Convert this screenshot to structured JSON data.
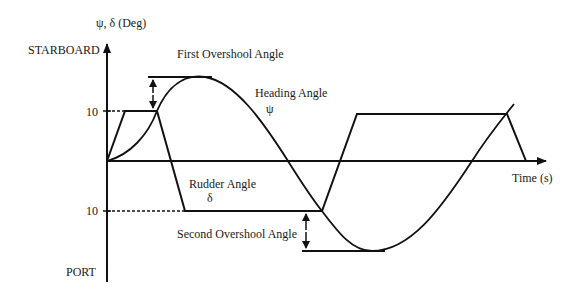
{
  "axes": {
    "y_label": "ψ, δ (Deg)",
    "x_label": "Time (s)",
    "y_top_label": "STARBOARD",
    "y_bottom_label": "PORT",
    "tick_upper": "10",
    "tick_lower": "10"
  },
  "annotations": {
    "first_overshoot": "First Overshool Angle",
    "second_overshoot": "Second Overshool Angle",
    "heading": "Heading Angle",
    "heading_symbol": "ψ",
    "rudder": "Rudder Angle",
    "rudder_symbol": "δ"
  },
  "colors": {
    "line": "#111111",
    "text": "#1a1a1a",
    "background": "#ffffff"
  }
}
